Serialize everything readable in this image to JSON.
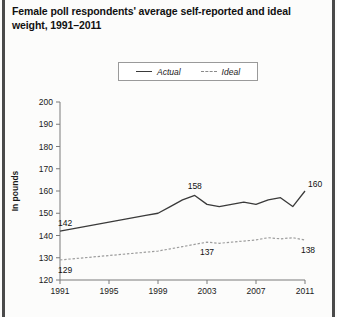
{
  "title": "Female poll respondents' average self-reported and ideal weight, 1991–2011",
  "legend": {
    "actual_label": "Actual",
    "ideal_label": "Ideal"
  },
  "axes": {
    "ylabel": "In pounds",
    "ytick_labels": [
      "200",
      "190",
      "180",
      "170",
      "160",
      "150",
      "140",
      "130",
      "120"
    ],
    "xtick_labels": [
      "1991",
      "1995",
      "1999",
      "2003",
      "2007",
      "2011"
    ]
  },
  "annotations": {
    "actual_start": "142",
    "actual_peak": "158",
    "actual_end": "160",
    "ideal_start": "129",
    "ideal_mid": "137",
    "ideal_end": "138"
  },
  "colors": {
    "actual_line": "#3a3a3a",
    "ideal_line": "#9d9d9d",
    "axis": "#7a7a7a",
    "text": "#111111",
    "gutter": "#4a4a4a"
  },
  "chart_data": {
    "type": "line",
    "title": "Female poll respondents' average self-reported and ideal weight, 1991–2011",
    "xlabel": "",
    "ylabel": "In pounds",
    "ylim": [
      120,
      200
    ],
    "xlim": [
      1991,
      2011
    ],
    "grid": false,
    "legend_position": "top-center",
    "x": [
      1991,
      1992,
      1993,
      1994,
      1995,
      1996,
      1997,
      1998,
      1999,
      2000,
      2001,
      2002,
      2003,
      2004,
      2005,
      2006,
      2007,
      2008,
      2009,
      2010,
      2011
    ],
    "series": [
      {
        "name": "Actual",
        "style": "solid",
        "values": [
          142,
          143,
          144,
          145,
          146,
          147,
          148,
          149,
          150,
          153,
          156,
          158,
          154,
          153,
          154,
          155,
          154,
          156,
          157,
          153,
          160
        ]
      },
      {
        "name": "Ideal",
        "style": "dashed",
        "values": [
          129,
          129.5,
          130,
          130.5,
          131,
          131.5,
          132,
          132.5,
          133,
          134,
          135,
          136,
          137,
          136.5,
          137,
          137.5,
          138,
          139,
          138.5,
          139,
          138
        ]
      }
    ],
    "point_labels": [
      {
        "series": "Actual",
        "x": 1991,
        "value": 142
      },
      {
        "series": "Actual",
        "x": 2002,
        "value": 158
      },
      {
        "series": "Actual",
        "x": 2011,
        "value": 160
      },
      {
        "series": "Ideal",
        "x": 1991,
        "value": 129
      },
      {
        "series": "Ideal",
        "x": 2003,
        "value": 137
      },
      {
        "series": "Ideal",
        "x": 2011,
        "value": 138
      }
    ]
  }
}
